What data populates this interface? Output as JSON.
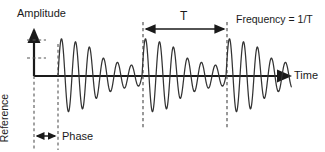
{
  "figure": {
    "type": "waveform-diagram",
    "title_visible": false,
    "axes": {
      "y_label": "Amplitude",
      "x_label": "Time",
      "origin_px": [
        34,
        76
      ],
      "y_axis_top_px": 28,
      "x_axis_right_px": 292
    },
    "annotations": {
      "period_marker": "T",
      "frequency_note": "Frequency = 1/T",
      "phase_marker": "Phase",
      "reference_marker": "Reference"
    },
    "markers": {
      "reference_dashed_x": 34,
      "phase_dashed_x": 58,
      "period_start_dashed_x": 143,
      "period_end_dashed_x": 227,
      "period_arrow_y": 29,
      "phase_arrow_y": 136,
      "y_tick_dashes_y": [
        40,
        58
      ]
    },
    "colors": {
      "background": "#ffffff",
      "axis": "#1a1a1a",
      "waveform": "#333333",
      "dashed": "#555555",
      "text": "#1a1a1a"
    }
  },
  "chart_data": {
    "type": "line",
    "title": "",
    "xlabel": "Time",
    "ylabel": "Amplitude",
    "grid": false,
    "legend": "none",
    "period_T_px": 84,
    "cycles_per_packet": 6,
    "packet_start_px": 58,
    "packet_peak_amplitudes_norm": [
      1.0,
      0.92,
      0.85,
      0.5,
      0.38,
      0.3
    ],
    "series": [
      {
        "name": "damped-oscillation",
        "packets": [
          {
            "index": 0,
            "start_px": 58,
            "end_px": 143
          },
          {
            "index": 1,
            "start_px": 143,
            "end_px": 227
          },
          {
            "index": 2,
            "start_px": 227,
            "end_px": 292,
            "clipped": true
          }
        ]
      }
    ],
    "ylim": [
      -1.1,
      1.1
    ],
    "y_tick_positions_norm": [
      0.95,
      0.5
    ]
  }
}
